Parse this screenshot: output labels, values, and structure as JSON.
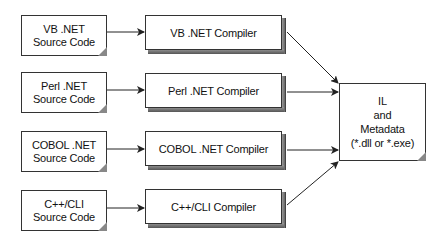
{
  "diagram": {
    "sources": [
      {
        "line1": "VB .NET",
        "line2": "Source Code"
      },
      {
        "line1": "Perl .NET",
        "line2": "Source Code"
      },
      {
        "line1": "COBOL .NET",
        "line2": "Source Code"
      },
      {
        "line1": "C++/CLI",
        "line2": "Source Code"
      }
    ],
    "compilers": [
      {
        "label": "VB .NET Compiler"
      },
      {
        "label": "Perl .NET Compiler"
      },
      {
        "label": "COBOL .NET Compiler"
      },
      {
        "label": "C++/CLI Compiler"
      }
    ],
    "output": {
      "line1": "IL",
      "line2": "and",
      "line3": "Metadata",
      "line4": "(*.dll or *.exe)"
    },
    "colors": {
      "stroke": "#333333",
      "bevel": "#777777",
      "fill": "#ffffff"
    }
  }
}
